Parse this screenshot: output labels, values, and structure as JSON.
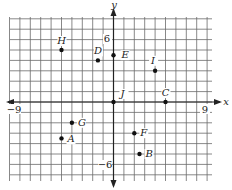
{
  "diagram": {
    "type": "coordinate-plane",
    "x_axis_label": "x",
    "y_axis_label": "y",
    "tick_labels": {
      "x_neg": "−9",
      "x_pos": "9",
      "y_pos": "6",
      "y_neg": "−6"
    },
    "colors": {
      "grid": "#6a6a6a",
      "axis": "#222222",
      "point": "#111111"
    }
  },
  "points": [
    {
      "label": "H",
      "x": -5,
      "y": 5
    },
    {
      "label": "D",
      "x": -1.5,
      "y": 4
    },
    {
      "label": "E",
      "x": 0,
      "y": 4.5
    },
    {
      "label": "I",
      "x": 4,
      "y": 3
    },
    {
      "label": "J",
      "x": 0,
      "y": 0
    },
    {
      "label": "C",
      "x": 5,
      "y": 0
    },
    {
      "label": "G",
      "x": -4,
      "y": -2
    },
    {
      "label": "A",
      "x": -5,
      "y": -3.5
    },
    {
      "label": "F",
      "x": 2,
      "y": -3
    },
    {
      "label": "B",
      "x": 2.5,
      "y": -5
    }
  ]
}
